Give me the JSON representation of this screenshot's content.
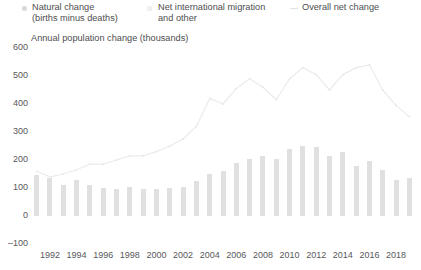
{
  "legend": {
    "items": [
      {
        "label": "Natural change\n(births minus deaths)",
        "marker": "circle-marker-icon",
        "color": "#d9d9d9"
      },
      {
        "label": "Net international migration\nand other",
        "marker": "square-marker-icon",
        "color": "#f0f0f0"
      },
      {
        "label": "Overall net change",
        "marker": "line-marker-icon",
        "color": "#e2e2e2"
      }
    ]
  },
  "axis_title": "Annual population change (thousands)",
  "chart_data": {
    "type": "bar",
    "title": "Annual population change (thousands)",
    "xlabel": "",
    "ylabel": "Annual population change (thousands)",
    "ylim": [
      -100,
      600
    ],
    "yticks": [
      600,
      500,
      400,
      300,
      200,
      100,
      0,
      -100
    ],
    "grid": false,
    "legend_position": "top",
    "categories": [
      "1991",
      "1992",
      "1993",
      "1994",
      "1995",
      "1996",
      "1997",
      "1998",
      "1999",
      "2000",
      "2001",
      "2002",
      "2003",
      "2004",
      "2005",
      "2006",
      "2007",
      "2008",
      "2009",
      "2010",
      "2011",
      "2012",
      "2013",
      "2014",
      "2015",
      "2016",
      "2017",
      "2018",
      "2019"
    ],
    "xtick_labels": [
      "1992",
      "1994",
      "1996",
      "1998",
      "2000",
      "2002",
      "2004",
      "2006",
      "2008",
      "2010",
      "2012",
      "2014",
      "2016",
      "2018"
    ],
    "series": [
      {
        "name": "Natural change (births minus deaths)",
        "type": "bar",
        "color": "#e0e0e0",
        "values": [
          145,
          135,
          110,
          130,
          110,
          100,
          95,
          105,
          95,
          95,
          100,
          105,
          125,
          150,
          160,
          190,
          205,
          215,
          205,
          240,
          250,
          245,
          215,
          230,
          180,
          195,
          165,
          130,
          135
        ]
      },
      {
        "name": "Overall net change",
        "type": "line",
        "color": "#ebebeb",
        "values": [
          160,
          140,
          150,
          165,
          185,
          185,
          200,
          215,
          215,
          230,
          250,
          275,
          320,
          420,
          400,
          455,
          490,
          460,
          415,
          490,
          530,
          505,
          450,
          505,
          530,
          540,
          450,
          395,
          355
        ]
      }
    ]
  }
}
